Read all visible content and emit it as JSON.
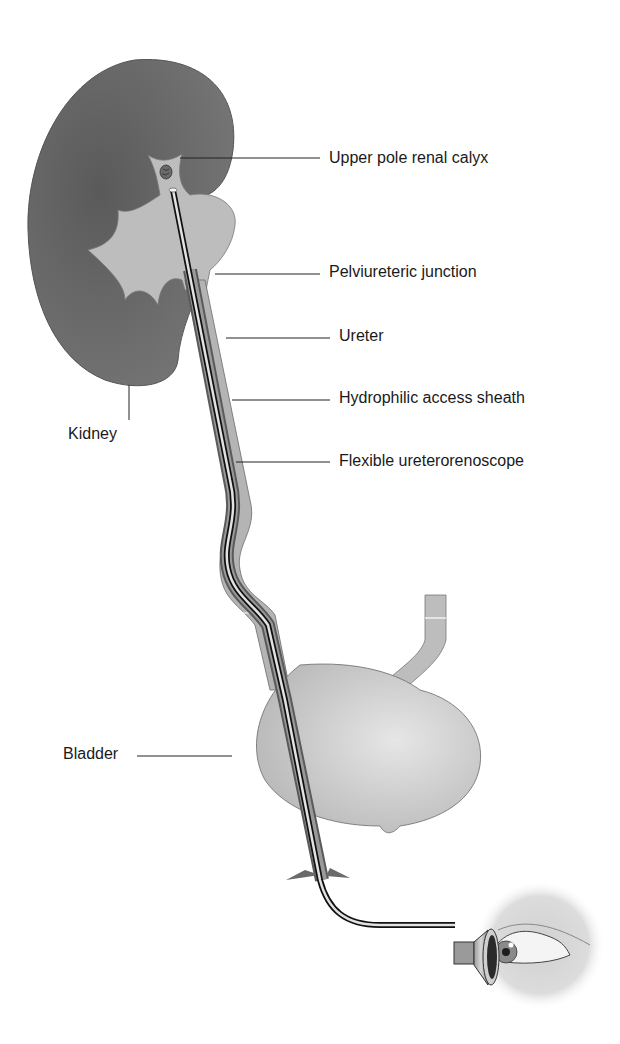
{
  "figure": {
    "type": "anatomical-diagram",
    "colors": {
      "kidney": "#6e6e6e",
      "collecting_system": "#bdbdbd",
      "ureter": "#b8b8b8",
      "bladder": "#c4c4c4",
      "scope_dark": "#1a1a1a",
      "scope_light": "#e0e0e0",
      "text": "#1a1a1a"
    }
  },
  "labels": {
    "upper_pole_calyx": "Upper pole renal calyx",
    "pelviureteric_junction": "Pelviureteric junction",
    "ureter": "Ureter",
    "access_sheath": "Hydrophilic access sheath",
    "ureterorenoscope": "Flexible ureterorenoscope",
    "kidney": "Kidney",
    "bladder": "Bladder"
  }
}
